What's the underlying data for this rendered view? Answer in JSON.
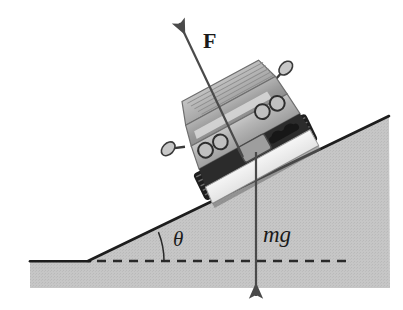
{
  "figure": {
    "caption": "",
    "background_color": "#ffffff",
    "incline_fill": "#c3c3c3",
    "ground_fill": "#c3c3c3",
    "line_color": "#1a1a1a",
    "arrow_color": "#4a4a4a",
    "canvas": {
      "width": 403,
      "height": 310
    }
  },
  "labels": {
    "force": "F",
    "weight": "mg",
    "angle": "θ"
  },
  "vectors": [
    {
      "name": "applied-force",
      "label": "F",
      "style": "bold",
      "direction": "up-left, parallel to incline",
      "tail": {
        "x": 243,
        "y": 157
      },
      "head": {
        "x": 177,
        "y": 18
      }
    },
    {
      "name": "weight-force",
      "label": "mg",
      "style": "italic",
      "direction": "straight down",
      "tail": {
        "x": 256,
        "y": 152
      },
      "head": {
        "x": 256,
        "y": 301
      }
    }
  ],
  "geometry": {
    "incline_angle_label": "θ",
    "incline_top_right": {
      "x": 389,
      "y": 116
    },
    "incline_vertex": {
      "x": 88,
      "y": 261
    },
    "ground_line_y": 261,
    "ground_left_x": 30,
    "region_bottom_y": 288,
    "dashed_line": {
      "from_x": 97,
      "to_x": 348,
      "y": 261,
      "dash": "9 7"
    },
    "angle_arc": {
      "center": {
        "x": 88,
        "y": 261
      },
      "radius": 76,
      "from_deg": 0,
      "to_deg": 22
    }
  },
  "car": {
    "name": "sports-car-rear-view",
    "orientation": "tilted, nose up the incline",
    "body_color": "#b8b8b8",
    "roof_color": "#a8a8a8",
    "window_color": "#9a9a9a",
    "bumper_color": "#2b2b2b",
    "lower_panel_color": "#f2f2f2",
    "tire_color": "#232323",
    "parts": [
      {
        "name": "rear-window",
        "count": 1
      },
      {
        "name": "taillight",
        "count": 4
      },
      {
        "name": "side-mirror",
        "count": 2
      },
      {
        "name": "license-plate",
        "count": 1
      },
      {
        "name": "exhaust-pipe",
        "count": 2
      },
      {
        "name": "tire",
        "count": 2
      },
      {
        "name": "rear-bumper",
        "count": 1
      }
    ]
  }
}
